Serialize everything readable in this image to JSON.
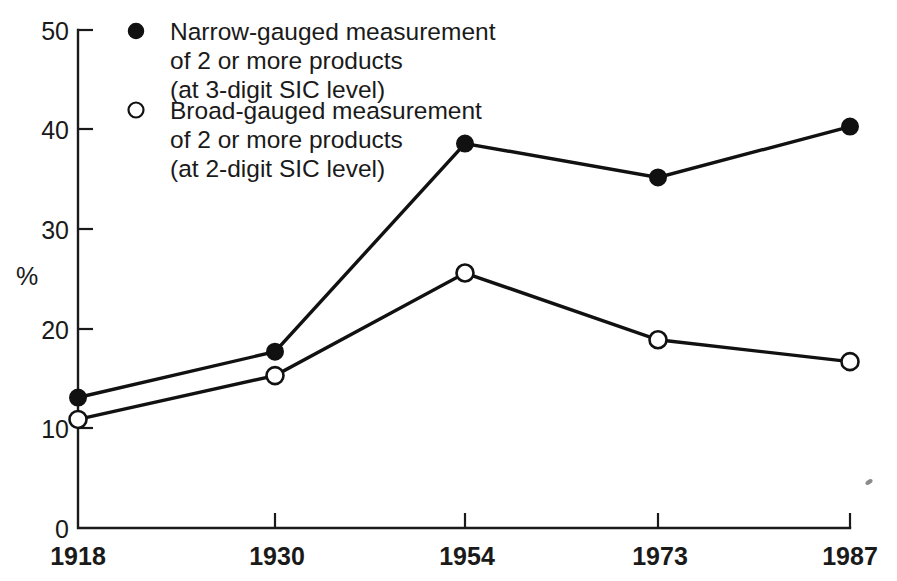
{
  "chart_data": {
    "type": "line",
    "title": "",
    "subtitle": "",
    "xlabel": "",
    "ylabel": "%",
    "categories": [
      "1918",
      "1930",
      "1954",
      "1973",
      "1987"
    ],
    "x": [
      1918,
      1930,
      1954,
      1973,
      1987
    ],
    "xlim": [
      1918,
      1987
    ],
    "ylim": [
      0,
      50
    ],
    "y_ticks": [
      0,
      10,
      20,
      30,
      40,
      50
    ],
    "y_tick_labels": [
      "0",
      "10",
      "20",
      "30",
      "40",
      "50"
    ],
    "x_tick_labels": [
      "1918",
      "1930",
      "1954",
      "1973",
      "1987"
    ],
    "grid": false,
    "legend_position": "top-left-inside",
    "series": [
      {
        "name": "Narrow-gauged  measurement of 2 or more products (at 3-digit SIC level)",
        "marker": "filled-circle",
        "values": [
          13.1,
          17.7,
          38.6,
          35.2,
          40.3
        ]
      },
      {
        "name": "Broad-gauged measurement of 2 or more products (at 2-digit SIC level)",
        "marker": "open-circle",
        "values": [
          10.9,
          15.3,
          25.6,
          18.9,
          16.7
        ]
      }
    ]
  },
  "axes": {
    "y_axis_title": "%",
    "y_tick_labels": [
      "50",
      "40",
      "30",
      "20",
      "10",
      "0"
    ],
    "x_tick_labels": [
      "1918",
      "1930",
      "1954",
      "1973",
      "1987"
    ]
  },
  "legend": {
    "entries": [
      {
        "marker": "filled-circle",
        "lines": [
          "Narrow-gauged  measurement",
          "of 2 or more products",
          "(at 3-digit SIC level)"
        ]
      },
      {
        "marker": "open-circle",
        "lines": [
          "Broad-gauged measurement",
          "of 2 or more products",
          "(at 2-digit SIC level)"
        ]
      }
    ]
  },
  "colors": {
    "ink": "#111111",
    "background": "#ffffff"
  }
}
